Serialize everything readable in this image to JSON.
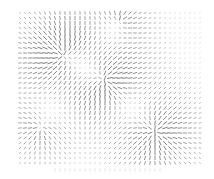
{
  "chart_data": {
    "type": "quiver",
    "title": "",
    "xlabel": "",
    "ylabel": "",
    "legend": [],
    "grid": false,
    "grid_layout": {
      "x_start": 20,
      "y_start": 13,
      "spacing": 5,
      "cols": 37,
      "rows": 31
    },
    "segment_color": "#555555",
    "max_length": 4.6,
    "sources": [
      {
        "name": "top-left-burst",
        "x": 62,
        "y": 55,
        "strength": 1.0,
        "radius": 38
      },
      {
        "name": "center-burst",
        "x": 105,
        "y": 80,
        "strength": 1.0,
        "radius": 36
      },
      {
        "name": "bottom-right-burst",
        "x": 155,
        "y": 132,
        "strength": 1.0,
        "radius": 34
      },
      {
        "name": "bottom-left-swirl",
        "x": 40,
        "y": 128,
        "strength": 0.7,
        "radius": 28
      },
      {
        "name": "top-center-flow",
        "x": 120,
        "y": 20,
        "strength": 0.6,
        "radius": 25
      }
    ],
    "bottom_tick_row_y": 170
  }
}
